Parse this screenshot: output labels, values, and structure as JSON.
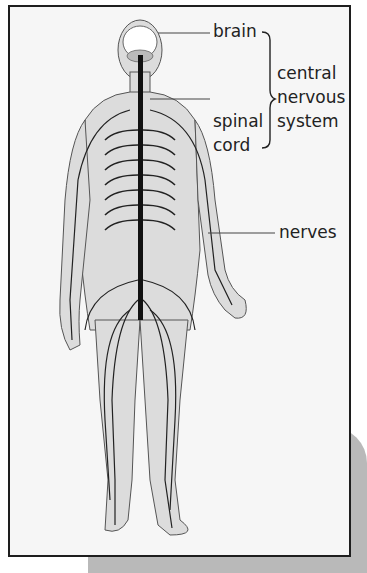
{
  "diagram": {
    "labels": {
      "brain": "brain",
      "spinal_line1": "spinal",
      "spinal_line2": "cord",
      "cns_line1": "central",
      "cns_line2": "nervous",
      "cns_line3": "system",
      "nerves": "nerves"
    },
    "colors": {
      "frame_border": "#1e1e1e",
      "frame_bg": "#f6f6f6",
      "shadow": "#b9b9b9",
      "body_fill": "#dcdcdc",
      "nerve": "#1a1a1a"
    }
  }
}
